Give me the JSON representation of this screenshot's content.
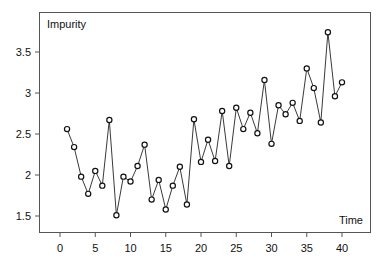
{
  "chart_data": {
    "type": "line",
    "title": "",
    "xlabel": "Time",
    "ylabel": "Impurity",
    "xlim": [
      -3.0,
      44.5
    ],
    "ylim": [
      1.3,
      3.95
    ],
    "x_ticks": [
      0,
      5,
      10,
      15,
      20,
      25,
      30,
      35,
      40
    ],
    "y_ticks": [
      1.5,
      2,
      2.5,
      3,
      3.5
    ],
    "y_tick_labels": [
      "1.5",
      "2",
      "2.5",
      "3",
      "3.5"
    ],
    "x_tick_labels": [
      "0",
      "5",
      "10",
      "15",
      "20",
      "25",
      "30",
      "35",
      "40"
    ],
    "grid": false,
    "legend": null,
    "markers": "open-circle",
    "series": [
      {
        "name": "Impurity",
        "x": [
          1,
          2,
          3,
          4,
          5,
          6,
          7,
          8,
          9,
          10,
          11,
          12,
          13,
          14,
          15,
          16,
          17,
          18,
          19,
          20,
          21,
          22,
          23,
          24,
          25,
          26,
          27,
          28,
          29,
          30,
          31,
          32,
          33,
          34,
          35,
          36,
          37,
          38,
          39,
          40
        ],
        "values": [
          2.56,
          2.34,
          1.98,
          1.77,
          2.05,
          1.87,
          2.67,
          1.51,
          1.98,
          1.92,
          2.11,
          2.37,
          1.7,
          1.94,
          1.58,
          1.87,
          2.1,
          1.64,
          2.68,
          2.16,
          2.43,
          2.17,
          2.78,
          2.11,
          2.82,
          2.56,
          2.76,
          2.51,
          3.16,
          2.38,
          2.85,
          2.74,
          2.88,
          2.66,
          3.3,
          3.06,
          2.64,
          3.74,
          2.96,
          3.13
        ]
      }
    ]
  },
  "labels": {
    "y_axis_annotation": "Impurity",
    "x_axis_annotation": "Time"
  }
}
